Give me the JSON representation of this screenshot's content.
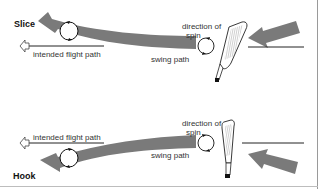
{
  "colors": {
    "band": "#7a7a7a",
    "line": "#222222",
    "background": "#ffffff"
  },
  "panels": {
    "slice": {
      "title": "Slice",
      "intended_flight_path": "intended flight path",
      "swing_path": "swing path",
      "direction_of_spin_line1": "direction of",
      "direction_of_spin_line2": "spin"
    },
    "hook": {
      "title": "Hook",
      "intended_flight_path": "intended flight path",
      "swing_path": "swing path",
      "direction_of_spin_line1": "direction of",
      "direction_of_spin_line2": "spin"
    }
  },
  "icons": {
    "ball_spin": "circle-with-arrows",
    "club": "golf-iron-clubhead",
    "flight_target": "hollow-arrowhead"
  }
}
